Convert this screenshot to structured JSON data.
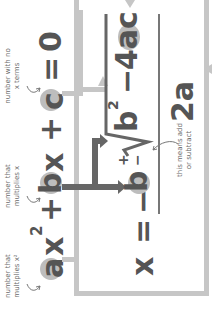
{
  "diagram": {
    "orientation": "rotated 90 degrees counter-clockwise",
    "equation": {
      "a_term": "a",
      "x_squared": "x",
      "exponent": "2",
      "plus1": "+",
      "b_term": "b",
      "x": "x",
      "plus2": "+",
      "c_term": "c",
      "equals": "=",
      "zero": "0"
    },
    "formula": {
      "x": "x",
      "equals": "=",
      "minus": "−",
      "b": "b",
      "plus_minus_plus": "+",
      "plus_minus_minus": "−",
      "radical": "√",
      "b2": "b",
      "b2_exp": "2",
      "minus2": "−",
      "four_ac": "4ac",
      "denominator": "2a"
    },
    "annotations": {
      "a": "number that multiplies x²",
      "b": "number that multiplies x",
      "c": "number with no x terms",
      "plus_minus": "this means add or subtract"
    },
    "colors": {
      "text": "#555555",
      "highlight": "#bdbdbd",
      "light_connector": "#c6c6c6",
      "dark_connector": "#666666",
      "annotation": "#6a6a6a"
    }
  }
}
